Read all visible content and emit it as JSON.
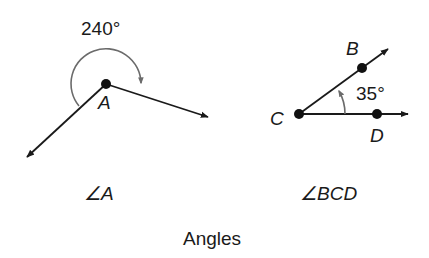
{
  "figure": {
    "caption": "Angles",
    "angle_a": {
      "measure_label": "240°",
      "vertex_label": "A",
      "name_label": "∠A"
    },
    "angle_bcd": {
      "measure_label": "35°",
      "vertex_label": "C",
      "point_b_label": "B",
      "point_d_label": "D",
      "name_label": "∠BCD"
    },
    "colors": {
      "line": "#1a1a1a",
      "arc": "#6b6b6b"
    }
  }
}
